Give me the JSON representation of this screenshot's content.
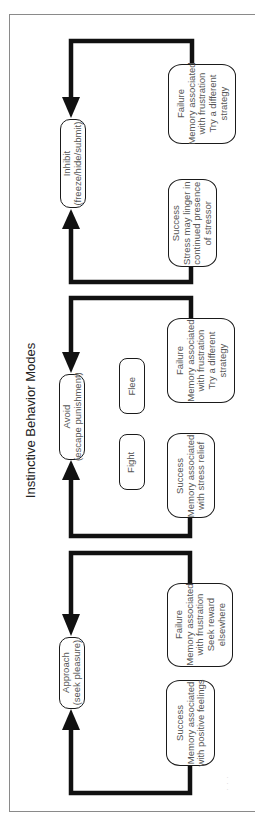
{
  "diagram": {
    "title": "Instinctive Behavior Modes",
    "page_mark": "· · ·",
    "colors": {
      "line": "#111111",
      "box_border": "#1a1a1a",
      "text": "#555555",
      "title": "#222222",
      "frame": "#8a8a8a"
    },
    "loops": [
      {
        "id": "inhibit",
        "mode": {
          "line1": "Inhibit",
          "line2": "(freeze/hide/submit)"
        },
        "failure": {
          "line1": "Failure",
          "line2": "Memory associated",
          "line3": "with frustration",
          "line4": "Try a different",
          "line5": "strategy"
        },
        "success": {
          "line1": "Success",
          "line2": "Stress may linger in",
          "line3": "continued presence",
          "line4": "of stressor"
        }
      },
      {
        "id": "avoid",
        "mode": {
          "line1": "Avoid",
          "line2": "(escape punishment)"
        },
        "options": [
          "Flee",
          "Fight"
        ],
        "failure": {
          "line1": "Failure",
          "line2": "Memory associated",
          "line3": "with frustration",
          "line4": "Try a different",
          "line5": "strategy"
        },
        "success": {
          "line1": "Success",
          "line2": "Memory associated",
          "line3": "with stress relief"
        }
      },
      {
        "id": "approach",
        "mode": {
          "line1": "Approach",
          "line2": "(seek pleasure)"
        },
        "failure": {
          "line1": "Failure",
          "line2": "Memory associated",
          "line3": "with frustration",
          "line4": "Seek reward",
          "line5": "elsewhere"
        },
        "success": {
          "line1": "Success",
          "line2": "Memory associated",
          "line3": "with positive feelings"
        }
      }
    ]
  }
}
